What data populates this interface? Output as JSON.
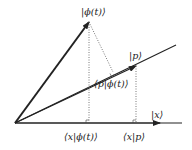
{
  "diagram": {
    "labels": {
      "phi_ket": "|ϕ(t)⟩",
      "p_ket": "|p⟩",
      "x_ket": "|x⟩",
      "p_phi_bracket": "⟨p|ϕ(t)⟩",
      "x_phi_bracket": "⟨x|ϕ(t)⟩",
      "x_p_bracket": "⟨x|p⟩"
    },
    "colors": {
      "line": "#222222",
      "dotted": "#555555"
    },
    "geometry": {
      "origin": [
        15,
        123
      ],
      "phi_tip": [
        89,
        22
      ],
      "p_line_end": [
        176,
        45
      ],
      "p_arrow_tip": [
        136,
        66
      ],
      "x_axis_end": [
        182,
        123
      ],
      "x_arrow_tip": [
        160,
        123
      ],
      "p_phi_projection": [
        113,
        72
      ]
    }
  }
}
